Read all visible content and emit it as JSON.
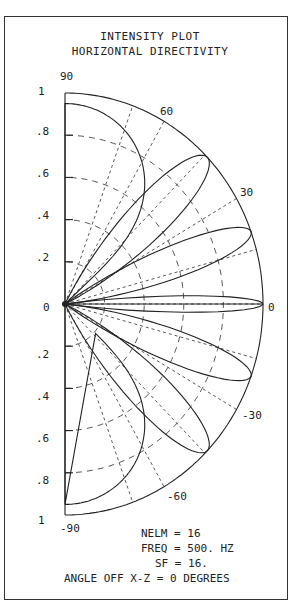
{
  "chart_data": {
    "type": "polar",
    "title": "INTENSITY PLOT",
    "subtitle": "HORIZONTAL DIRECTIVITY",
    "radial_ticks": [
      ".2",
      ".4",
      ".6",
      ".8",
      "1"
    ],
    "radial_zero_label": "0",
    "angle_labels": [
      {
        "angle": 90,
        "label": "90"
      },
      {
        "angle": 60,
        "label": "60"
      },
      {
        "angle": 30,
        "label": "30"
      },
      {
        "angle": 0,
        "label": "0"
      },
      {
        "angle": -30,
        "label": "-30"
      },
      {
        "angle": -60,
        "label": "-60"
      },
      {
        "angle": -90,
        "label": "-90"
      }
    ],
    "angle_range": [
      -90,
      90
    ],
    "r_range": [
      0,
      1
    ],
    "grid": {
      "r_arcs": [
        0.2,
        0.4,
        0.6,
        0.8
      ],
      "spokes_deg": [
        70,
        60,
        45,
        30,
        15,
        0,
        -15,
        -30,
        -45,
        -60,
        -70
      ]
    },
    "lobes": [
      {
        "center_deg": 0,
        "peak": 1.0,
        "half_width_deg": 3.5
      },
      {
        "center_deg": 20,
        "peak": 1.0,
        "half_width_deg": 7
      },
      {
        "center_deg": -20,
        "peak": 1.0,
        "half_width_deg": 7
      },
      {
        "center_deg": 44,
        "peak": 1.0,
        "half_width_deg": 9
      },
      {
        "center_deg": -44,
        "peak": 1.0,
        "half_width_deg": 9
      },
      {
        "center_deg": 90,
        "peak": 0.95,
        "half_width_deg": 22
      },
      {
        "center_deg": -90,
        "peak": 0.95,
        "half_width_deg": 22
      }
    ],
    "parameters": [
      {
        "name": "NELM",
        "value": "16"
      },
      {
        "name": "FREQ",
        "value": "500. HZ"
      },
      {
        "name": "SF",
        "value": "16."
      },
      {
        "name": "ANGLE OFF X-Z",
        "value": "0 DEGREES"
      }
    ]
  },
  "header": {
    "title": "INTENSITY PLOT",
    "subtitle": "HORIZONTAL DIRECTIVITY"
  },
  "info": {
    "nelm": "NELM = 16",
    "freq": "FREQ = 500. HZ",
    "sf": "SF = 16.",
    "angle": "ANGLE OFF X-Z = 0 DEGREES"
  },
  "labels": {
    "a90": "90",
    "a60": "60",
    "a30": "30",
    "a0": "0",
    "am30": "-30",
    "am60": "-60",
    "am90": "-90",
    "r1_top": "1",
    "r08_top": ".8",
    "r06_top": ".6",
    "r04_top": ".4",
    "r02_top": ".2",
    "r0": "0",
    "r02_bot": ".2",
    "r04_bot": ".4",
    "r06_bot": ".6",
    "r08_bot": ".8",
    "r1_bot": "1"
  }
}
